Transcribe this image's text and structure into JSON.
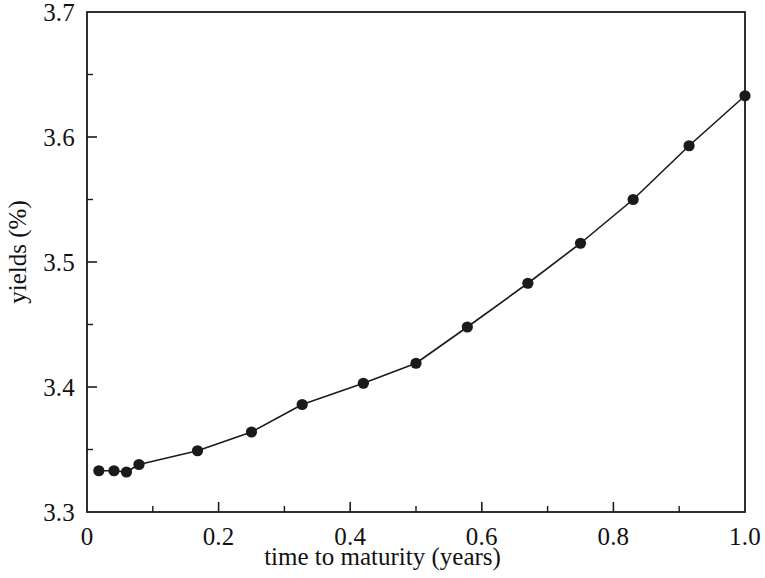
{
  "chart_data": {
    "type": "line",
    "title": "",
    "xlabel": "time to maturity (years)",
    "ylabel": "yields (%)",
    "xlim": [
      0,
      1.0
    ],
    "ylim": [
      3.3,
      3.7
    ],
    "grid": false,
    "legend": null,
    "marker": "filled-circle",
    "line_color": "#1a1a1a",
    "marker_color": "#1a1a1a",
    "x_major_ticks": [
      0,
      0.2,
      0.4,
      0.6,
      0.8,
      1.0
    ],
    "x_major_tick_labels": [
      "0",
      "0.2",
      "0.4",
      "0.6",
      "0.8",
      "1.0"
    ],
    "x_minor_ticks": [
      0.1,
      0.3,
      0.5,
      0.7,
      0.9
    ],
    "y_major_ticks": [
      3.3,
      3.4,
      3.5,
      3.6,
      3.7
    ],
    "y_major_tick_labels": [
      "3.3",
      "3.4",
      "3.5",
      "3.6",
      "3.7"
    ],
    "y_minor_ticks": [
      3.35,
      3.45,
      3.55,
      3.65
    ],
    "x": [
      0.018,
      0.041,
      0.06,
      0.079,
      0.168,
      0.25,
      0.327,
      0.42,
      0.5,
      0.578,
      0.67,
      0.75,
      0.83,
      0.915,
      1.0
    ],
    "values": [
      3.333,
      3.333,
      3.332,
      3.338,
      3.349,
      3.364,
      3.386,
      3.403,
      3.419,
      3.448,
      3.483,
      3.515,
      3.55,
      3.593,
      3.633
    ],
    "series": [
      {
        "name": "yield curve",
        "x": [
          0.018,
          0.041,
          0.06,
          0.079,
          0.168,
          0.25,
          0.327,
          0.42,
          0.5,
          0.578,
          0.67,
          0.75,
          0.83,
          0.915,
          1.0
        ],
        "values": [
          3.333,
          3.333,
          3.332,
          3.338,
          3.349,
          3.364,
          3.386,
          3.403,
          3.419,
          3.448,
          3.483,
          3.515,
          3.55,
          3.593,
          3.633
        ]
      }
    ]
  },
  "axes": {
    "x_title": "time to maturity (years)",
    "y_title": "yields (%)",
    "x_tick_labels": [
      "0",
      "0.2",
      "0.4",
      "0.6",
      "0.8",
      "1.0"
    ],
    "y_tick_labels": [
      "3.3",
      "3.4",
      "3.5",
      "3.6",
      "3.7"
    ]
  }
}
